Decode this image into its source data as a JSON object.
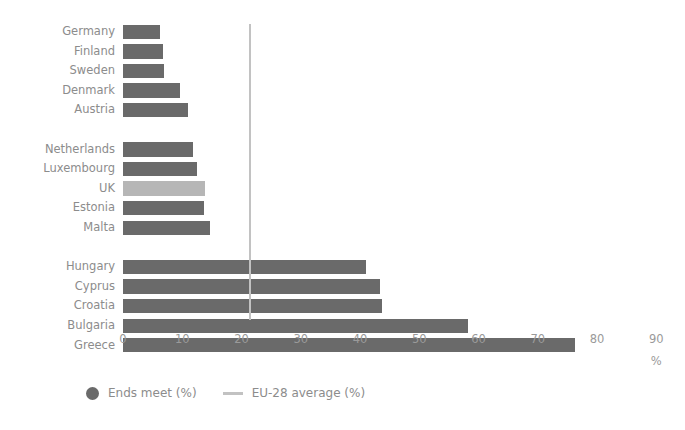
{
  "chart_data": {
    "type": "bar",
    "orientation": "horizontal",
    "title": "",
    "xlabel": "%",
    "ylabel": "",
    "xlim": [
      0,
      90
    ],
    "xticks": [
      0,
      10,
      20,
      30,
      40,
      50,
      60,
      70,
      80,
      90
    ],
    "grid": false,
    "legend_position": "bottom-left",
    "categories": [
      "Germany",
      "Finland",
      "Sweden",
      "Denmark",
      "Austria",
      "Netherlands",
      "Luxembourg",
      "UK",
      "Estonia",
      "Malta",
      "Hungary",
      "Cyprus",
      "Croatia",
      "Bulgaria",
      "Greece"
    ],
    "values": [
      6.2,
      6.7,
      7.0,
      9.6,
      11.0,
      11.8,
      12.5,
      13.8,
      13.6,
      14.6,
      41.0,
      43.3,
      43.7,
      58.2,
      76.3
    ],
    "series": [
      {
        "name": "Ends meet (%)",
        "values": [
          6.2,
          6.7,
          7.0,
          9.6,
          11.0,
          11.8,
          12.5,
          13.8,
          13.6,
          14.6,
          41.0,
          43.3,
          43.7,
          58.2,
          76.3
        ]
      }
    ],
    "highlight_category": "UK",
    "reference_line": {
      "label": "EU-28 average (%)",
      "value": 21.3
    },
    "group_breaks_after": [
      "Austria",
      "Malta"
    ],
    "colors": {
      "bar": "#6a6a6a",
      "bar_highlight": "#b6b6b6",
      "reference_line": "#c2c2c2",
      "text": "#8c8c8c",
      "background": "#ffffff"
    }
  },
  "legend": {
    "items": [
      {
        "label": "Ends meet (%)",
        "marker": "dot-marker-icon"
      },
      {
        "label": "EU-28 average (%)",
        "marker": "line-marker-icon"
      }
    ]
  },
  "axis": {
    "unit_label": "%",
    "ticks": [
      "0",
      "10",
      "20",
      "30",
      "40",
      "50",
      "60",
      "70",
      "80",
      "90"
    ]
  }
}
